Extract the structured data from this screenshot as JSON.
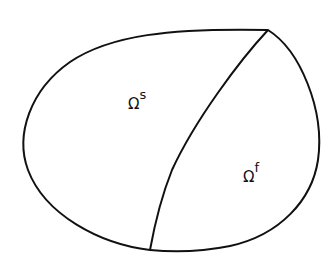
{
  "diagram": {
    "regions": [
      {
        "id": "solid",
        "symbol": "Ω",
        "superscript": "s"
      },
      {
        "id": "fluid",
        "symbol": "Ω",
        "superscript": "f"
      }
    ],
    "colors": {
      "stroke": "#111111",
      "background": "#ffffff"
    }
  }
}
